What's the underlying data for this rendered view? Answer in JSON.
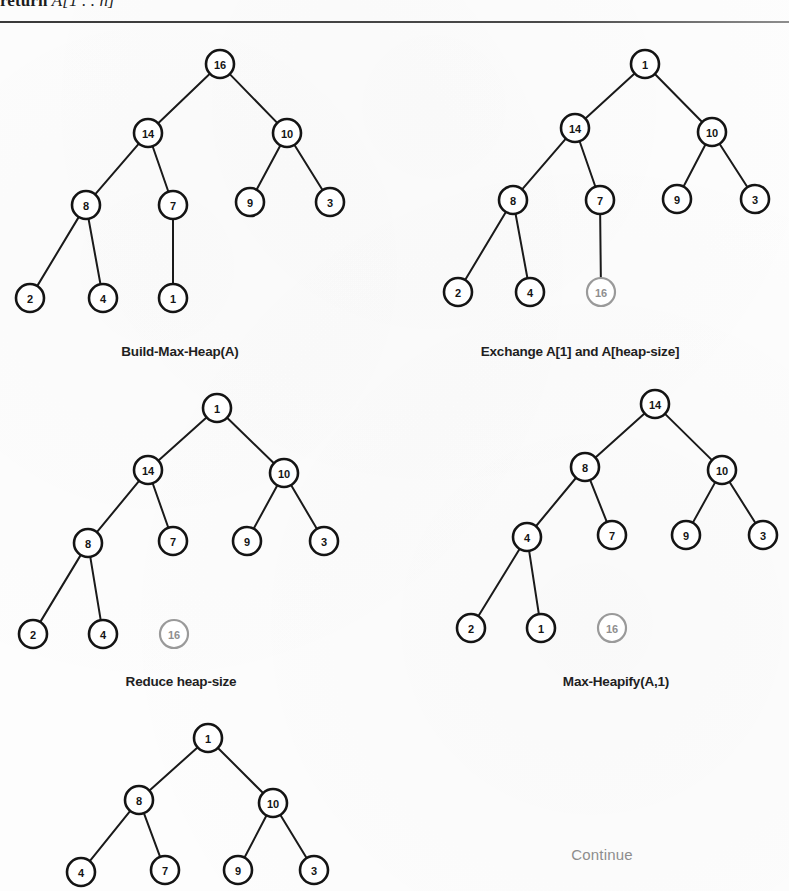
{
  "header": {
    "keyword": "return",
    "expression": "A[1 . . n]"
  },
  "figure": {
    "continue_label": "Continue"
  },
  "chart_data": {
    "type": "diagram",
    "panels": [
      {
        "id": "build-max-heap",
        "caption": "Build-Max-Heap(A)",
        "nodes": [
          {
            "id": "n0",
            "value": "16",
            "x": 220,
            "y": 64,
            "dim": false
          },
          {
            "id": "n1",
            "value": "14",
            "x": 148,
            "y": 133,
            "dim": false
          },
          {
            "id": "n2",
            "value": "10",
            "x": 287,
            "y": 133,
            "dim": false
          },
          {
            "id": "n3",
            "value": "8",
            "x": 86,
            "y": 205,
            "dim": false
          },
          {
            "id": "n4",
            "value": "7",
            "x": 173,
            "y": 205,
            "dim": false
          },
          {
            "id": "n5",
            "value": "9",
            "x": 250,
            "y": 202,
            "dim": false
          },
          {
            "id": "n6",
            "value": "3",
            "x": 330,
            "y": 202,
            "dim": false
          },
          {
            "id": "n7",
            "value": "2",
            "x": 30,
            "y": 298,
            "dim": false
          },
          {
            "id": "n8",
            "value": "4",
            "x": 103,
            "y": 298,
            "dim": false
          },
          {
            "id": "n9",
            "value": "1",
            "x": 173,
            "y": 298,
            "dim": false
          }
        ],
        "edges": [
          [
            "n0",
            "n1"
          ],
          [
            "n0",
            "n2"
          ],
          [
            "n1",
            "n3"
          ],
          [
            "n1",
            "n4"
          ],
          [
            "n2",
            "n5"
          ],
          [
            "n2",
            "n6"
          ],
          [
            "n3",
            "n7"
          ],
          [
            "n3",
            "n8"
          ],
          [
            "n4",
            "n9"
          ]
        ]
      },
      {
        "id": "exchange",
        "caption": "Exchange A[1] and A[heap-size]",
        "nodes": [
          {
            "id": "n0",
            "value": "1",
            "x": 645,
            "y": 64,
            "dim": false
          },
          {
            "id": "n1",
            "value": "14",
            "x": 575,
            "y": 128,
            "dim": false
          },
          {
            "id": "n2",
            "value": "10",
            "x": 712,
            "y": 132,
            "dim": false
          },
          {
            "id": "n3",
            "value": "8",
            "x": 513,
            "y": 200,
            "dim": false
          },
          {
            "id": "n4",
            "value": "7",
            "x": 600,
            "y": 200,
            "dim": false
          },
          {
            "id": "n5",
            "value": "9",
            "x": 677,
            "y": 199,
            "dim": false
          },
          {
            "id": "n6",
            "value": "3",
            "x": 755,
            "y": 199,
            "dim": false
          },
          {
            "id": "n7",
            "value": "2",
            "x": 458,
            "y": 292,
            "dim": false
          },
          {
            "id": "n8",
            "value": "4",
            "x": 530,
            "y": 292,
            "dim": false
          },
          {
            "id": "n9",
            "value": "16",
            "x": 601,
            "y": 292,
            "dim": true
          }
        ],
        "edges": [
          [
            "n0",
            "n1"
          ],
          [
            "n0",
            "n2"
          ],
          [
            "n1",
            "n3"
          ],
          [
            "n1",
            "n4"
          ],
          [
            "n2",
            "n5"
          ],
          [
            "n2",
            "n6"
          ],
          [
            "n3",
            "n7"
          ],
          [
            "n3",
            "n8"
          ],
          [
            "n4",
            "n9"
          ]
        ]
      },
      {
        "id": "reduce-heap-size",
        "caption": "Reduce heap-size",
        "nodes": [
          {
            "id": "n0",
            "value": "1",
            "x": 217,
            "y": 408,
            "dim": false
          },
          {
            "id": "n1",
            "value": "14",
            "x": 148,
            "y": 470,
            "dim": false
          },
          {
            "id": "n2",
            "value": "10",
            "x": 284,
            "y": 473,
            "dim": false
          },
          {
            "id": "n3",
            "value": "8",
            "x": 88,
            "y": 543,
            "dim": false
          },
          {
            "id": "n4",
            "value": "7",
            "x": 173,
            "y": 541,
            "dim": false
          },
          {
            "id": "n5",
            "value": "9",
            "x": 247,
            "y": 541,
            "dim": false
          },
          {
            "id": "n6",
            "value": "3",
            "x": 324,
            "y": 541,
            "dim": false
          },
          {
            "id": "n7",
            "value": "2",
            "x": 33,
            "y": 634,
            "dim": false
          },
          {
            "id": "n8",
            "value": "4",
            "x": 103,
            "y": 634,
            "dim": false
          },
          {
            "id": "n9",
            "value": "16",
            "x": 174,
            "y": 634,
            "dim": true
          }
        ],
        "edges": [
          [
            "n0",
            "n1"
          ],
          [
            "n0",
            "n2"
          ],
          [
            "n1",
            "n3"
          ],
          [
            "n1",
            "n4"
          ],
          [
            "n2",
            "n5"
          ],
          [
            "n2",
            "n6"
          ],
          [
            "n3",
            "n7"
          ],
          [
            "n3",
            "n8"
          ]
        ]
      },
      {
        "id": "max-heapify",
        "caption": "Max-Heapify(A,1)",
        "nodes": [
          {
            "id": "n0",
            "value": "14",
            "x": 655,
            "y": 404,
            "dim": false
          },
          {
            "id": "n1",
            "value": "8",
            "x": 585,
            "y": 467,
            "dim": false
          },
          {
            "id": "n2",
            "value": "10",
            "x": 722,
            "y": 470,
            "dim": false
          },
          {
            "id": "n3",
            "value": "4",
            "x": 527,
            "y": 537,
            "dim": false
          },
          {
            "id": "n4",
            "value": "7",
            "x": 612,
            "y": 535,
            "dim": false
          },
          {
            "id": "n5",
            "value": "9",
            "x": 686,
            "y": 535,
            "dim": false
          },
          {
            "id": "n6",
            "value": "3",
            "x": 763,
            "y": 535,
            "dim": false
          },
          {
            "id": "n7",
            "value": "2",
            "x": 471,
            "y": 628,
            "dim": false
          },
          {
            "id": "n8",
            "value": "1",
            "x": 541,
            "y": 628,
            "dim": false
          },
          {
            "id": "n9",
            "value": "16",
            "x": 612,
            "y": 628,
            "dim": true
          }
        ],
        "edges": [
          [
            "n0",
            "n1"
          ],
          [
            "n0",
            "n2"
          ],
          [
            "n1",
            "n3"
          ],
          [
            "n1",
            "n4"
          ],
          [
            "n2",
            "n5"
          ],
          [
            "n2",
            "n6"
          ],
          [
            "n3",
            "n7"
          ],
          [
            "n3",
            "n8"
          ]
        ]
      },
      {
        "id": "continue-step",
        "caption": "",
        "nodes": [
          {
            "id": "n0",
            "value": "1",
            "x": 208,
            "y": 738,
            "dim": false
          },
          {
            "id": "n1",
            "value": "8",
            "x": 139,
            "y": 800,
            "dim": false
          },
          {
            "id": "n2",
            "value": "10",
            "x": 273,
            "y": 803,
            "dim": false
          },
          {
            "id": "n3",
            "value": "4",
            "x": 81,
            "y": 872,
            "dim": false
          },
          {
            "id": "n4",
            "value": "7",
            "x": 165,
            "y": 870,
            "dim": false
          },
          {
            "id": "n5",
            "value": "9",
            "x": 238,
            "y": 870,
            "dim": false
          },
          {
            "id": "n6",
            "value": "3",
            "x": 314,
            "y": 870,
            "dim": false
          }
        ],
        "edges": [
          [
            "n0",
            "n1"
          ],
          [
            "n0",
            "n2"
          ],
          [
            "n1",
            "n3"
          ],
          [
            "n1",
            "n4"
          ],
          [
            "n2",
            "n5"
          ],
          [
            "n2",
            "n6"
          ]
        ]
      }
    ],
    "captions": [
      {
        "text": "Build-Max-Heap(A)",
        "x": 180,
        "y": 351,
        "muted": false
      },
      {
        "text": "Exchange A[1] and A[heap-size]",
        "x": 580,
        "y": 351,
        "muted": false
      },
      {
        "text": "Reduce heap-size",
        "x": 181,
        "y": 681,
        "muted": false
      },
      {
        "text": "Max-Heapify(A,1)",
        "x": 616,
        "y": 681,
        "muted": false
      },
      {
        "text": "Continue",
        "x": 602,
        "y": 854,
        "muted": true
      }
    ],
    "node_radius": 14,
    "dim_color": "#9a9a9a",
    "node_color": "#141414",
    "edge_color": "#1a1a1a"
  }
}
